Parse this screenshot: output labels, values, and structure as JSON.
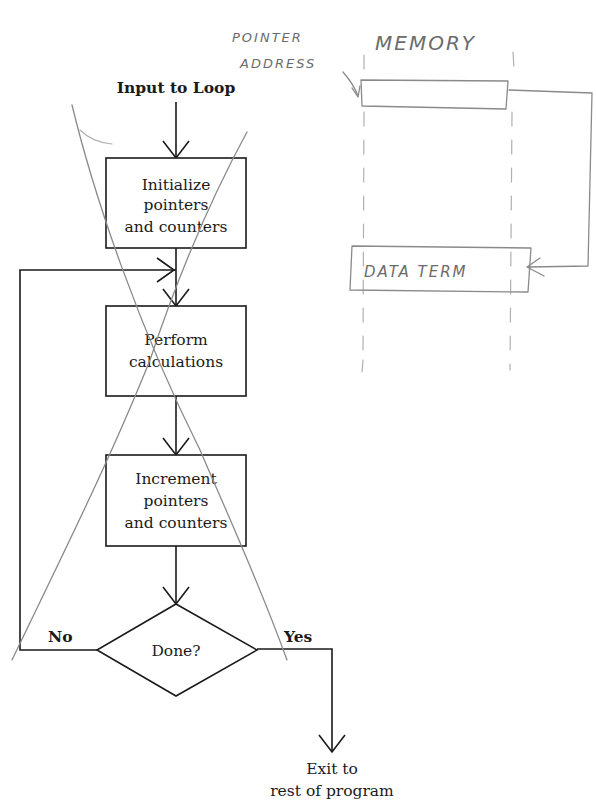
{
  "flowchart": {
    "input_label": "Input to Loop",
    "steps": [
      {
        "id": "init",
        "lines": [
          "Initialize",
          "pointers",
          "and counters"
        ]
      },
      {
        "id": "calc",
        "lines": [
          "Perform",
          "calculations"
        ]
      },
      {
        "id": "incr",
        "lines": [
          "Increment",
          "pointers",
          "and counters"
        ]
      }
    ],
    "decision": {
      "label": "Done?",
      "no_label": "No",
      "yes_label": "Yes"
    },
    "exit_lines": [
      "Exit to",
      "rest of program"
    ]
  },
  "annotations": {
    "pointer_label_lines": [
      "POINTER",
      "ADDRESS"
    ],
    "memory_label": "MEMORY",
    "data_term_label": "DATA TERM",
    "crossed_out": true
  },
  "colors": {
    "ink": "#1a1a1a",
    "pencil": "#8a8a8a",
    "background": "#ffffff"
  }
}
